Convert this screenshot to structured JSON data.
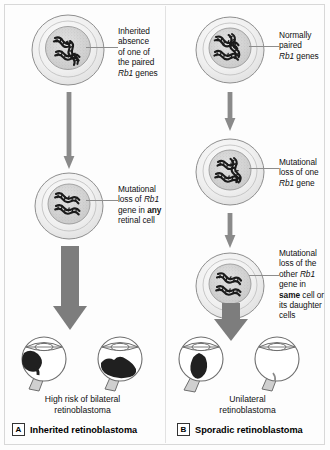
{
  "figure": {
    "colors": {
      "cell_membrane": "#f1f1f1",
      "cell_outline": "#8f8f8f",
      "nucleus": "#d9d9d9",
      "dna": "#1b1b1b",
      "arrow_gray": "#8a8a8a",
      "arrow_thick": "#7d7d7d",
      "tumor": "#202020",
      "eye_outline": "#6e6e6e",
      "eye_fill": "#ffffff",
      "optic_nerve": "#cfcfcf",
      "frame": "#d8d8d8"
    }
  },
  "panels": [
    {
      "id": "A",
      "badge": "A",
      "label": "Inherited retinoblastoma",
      "caption_line1": "High risk of bilateral",
      "caption_line2": "retinoblastoma",
      "steps": [
        {
          "name": "germline-cell",
          "dna_state": "one-absent",
          "callout_lines": [
            {
              "text": "Inherited"
            },
            {
              "text": "absence"
            },
            {
              "text": "of one of"
            },
            {
              "text": "the paired"
            },
            {
              "text": "Rb1 genes",
              "italic_word": "Rb1"
            }
          ]
        },
        {
          "name": "retinal-cell",
          "dna_state": "second-hit",
          "callout_lines": [
            {
              "text": "Mutational"
            },
            {
              "text": "loss of Rb1",
              "italic_word": "Rb1"
            },
            {
              "text": "gene in any",
              "bold_word": "any"
            },
            {
              "text": "retinal cell"
            }
          ]
        }
      ],
      "eyes": [
        {
          "name": "eye-left",
          "tumor": true
        },
        {
          "name": "eye-right",
          "tumor": true
        }
      ],
      "arrows": [
        {
          "name": "thin-arrow-1",
          "type": "thin"
        },
        {
          "name": "thick-arrow-1",
          "type": "thick"
        }
      ]
    },
    {
      "id": "B",
      "badge": "B",
      "label": "Sporadic retinoblastoma",
      "caption_line1": "Unilateral",
      "caption_line2": "retinoblastoma",
      "steps": [
        {
          "name": "normal-cell",
          "dna_state": "normal-pair",
          "callout_lines": [
            {
              "text": "Normally"
            },
            {
              "text": "paired"
            },
            {
              "text": "Rb1 genes",
              "italic_word": "Rb1"
            }
          ]
        },
        {
          "name": "first-hit-cell",
          "dna_state": "one-lost",
          "callout_lines": [
            {
              "text": "Mutational"
            },
            {
              "text": "loss of one"
            },
            {
              "text": "Rb1 gene",
              "italic_word": "Rb1"
            }
          ]
        },
        {
          "name": "second-hit-cell",
          "dna_state": "second-hit",
          "callout_lines": [
            {
              "text": "Mutational"
            },
            {
              "text": "loss of the"
            },
            {
              "text": "other Rb1",
              "italic_word": "Rb1"
            },
            {
              "text": "gene in"
            },
            {
              "text": "same cell or",
              "bold_word": "same"
            },
            {
              "text": "its daughter"
            },
            {
              "text": "cells"
            }
          ]
        }
      ],
      "eyes": [
        {
          "name": "eye-left",
          "tumor": true
        },
        {
          "name": "eye-right",
          "tumor": false
        }
      ],
      "arrows": [
        {
          "name": "thin-arrow-1",
          "type": "thin"
        },
        {
          "name": "thin-arrow-2",
          "type": "thin"
        },
        {
          "name": "thick-arrow-1",
          "type": "thick"
        }
      ]
    }
  ]
}
